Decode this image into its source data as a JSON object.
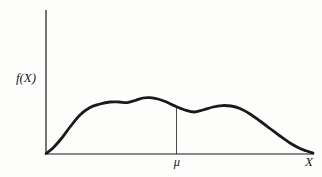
{
  "figure": {
    "y_axis_label": "f(X)",
    "x_axis_label": "X",
    "mean_label": "μ",
    "ink_color": "#1a1a1a",
    "background_color": "#fdfdfc"
  },
  "chart_data": {
    "type": "line",
    "title": "",
    "xlabel": "X",
    "ylabel": "f(X)",
    "x_tick_labels": [
      "μ"
    ],
    "y_tick_labels": [],
    "grid": false,
    "legend": null,
    "axes_px": {
      "origin": [
        46,
        154
      ],
      "x_end": [
        314,
        154
      ],
      "y_top": [
        46,
        10
      ]
    },
    "annotations": [
      {
        "type": "vertical-line",
        "label": "μ",
        "x_px": 176.5,
        "y_from_px": 107,
        "y_to_px": 154
      }
    ],
    "series": [
      {
        "name": "f(X)",
        "points_px": [
          [
            46,
            153.5
          ],
          [
            53,
            148
          ],
          [
            61,
            139
          ],
          [
            70,
            127
          ],
          [
            80,
            115
          ],
          [
            90,
            107.5
          ],
          [
            100,
            104
          ],
          [
            110,
            102
          ],
          [
            119,
            102
          ],
          [
            127,
            102.6
          ],
          [
            135,
            100.5
          ],
          [
            143,
            98
          ],
          [
            150,
            97.6
          ],
          [
            158,
            99
          ],
          [
            166,
            101.8
          ],
          [
            176,
            106.5
          ],
          [
            185,
            110
          ],
          [
            194,
            112
          ],
          [
            203,
            110
          ],
          [
            213,
            107
          ],
          [
            222,
            105.6
          ],
          [
            231,
            106
          ],
          [
            240,
            108.5
          ],
          [
            250,
            114
          ],
          [
            260,
            121
          ],
          [
            270,
            128.5
          ],
          [
            280,
            136
          ],
          [
            290,
            143
          ],
          [
            299,
            148
          ],
          [
            306,
            150.8
          ],
          [
            313,
            153
          ]
        ]
      }
    ],
    "style": {
      "curve_stroke_px": 2.8,
      "axis_stroke_px": 1.2,
      "annotation_stroke_px": 0.8
    }
  }
}
